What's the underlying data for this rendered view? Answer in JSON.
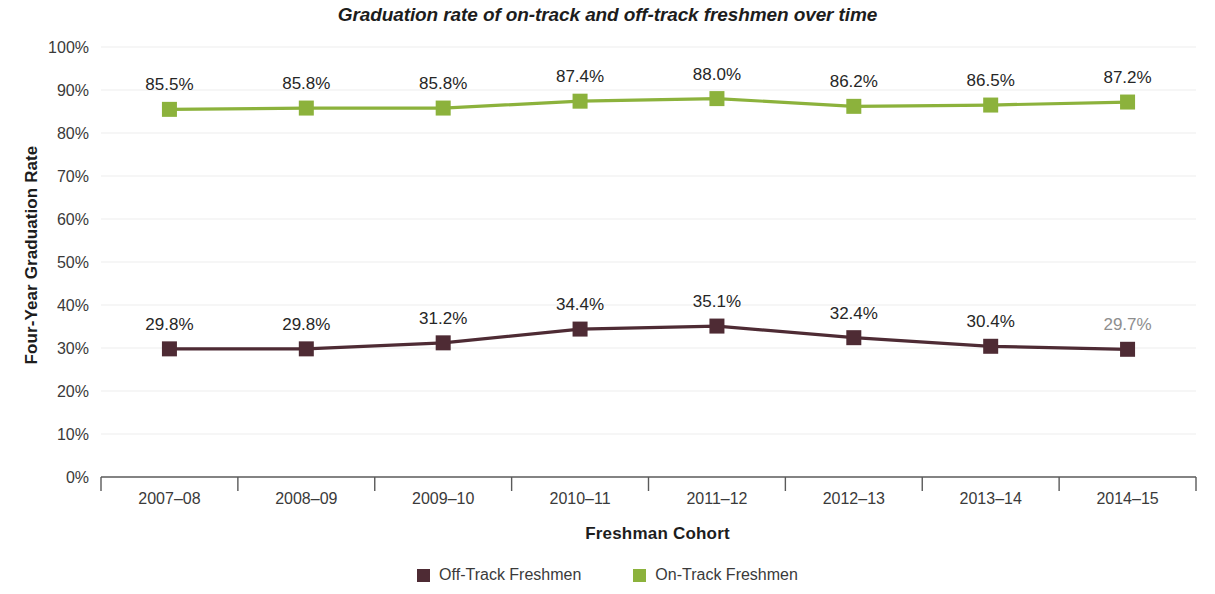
{
  "chart_data": {
    "type": "line",
    "title": "Graduation rate of on-track and off-track freshmen over time",
    "xlabel": "Freshman Cohort",
    "ylabel": "Four-Year Graduation Rate",
    "categories": [
      "2007–08",
      "2008–09",
      "2009–10",
      "2010–11",
      "2011–12",
      "2012–13",
      "2013–14",
      "2014–15"
    ],
    "ylim": [
      0,
      100
    ],
    "ytick_labels": [
      "0%",
      "10%",
      "20%",
      "30%",
      "40%",
      "50%",
      "60%",
      "70%",
      "80%",
      "90%",
      "100%"
    ],
    "ytick_values": [
      0,
      10,
      20,
      30,
      40,
      50,
      60,
      70,
      80,
      90,
      100
    ],
    "grid": "horizontal",
    "legend_position": "bottom-center",
    "series": [
      {
        "name": "Off-Track Freshmen",
        "color": "#4e2b34",
        "values": [
          29.8,
          29.8,
          31.2,
          34.4,
          35.1,
          32.4,
          30.4,
          29.7
        ],
        "labels": [
          "29.8%",
          "29.8%",
          "31.2%",
          "34.4%",
          "35.1%",
          "32.4%",
          "30.4%",
          "29.7%"
        ],
        "label_styles": [
          "normal",
          "normal",
          "normal",
          "normal",
          "normal",
          "normal",
          "normal",
          "muted"
        ]
      },
      {
        "name": "On-Track Freshmen",
        "color": "#8cb23c",
        "values": [
          85.5,
          85.8,
          85.8,
          87.4,
          88.0,
          86.2,
          86.5,
          87.2
        ],
        "labels": [
          "85.5%",
          "85.8%",
          "85.8%",
          "87.4%",
          "88.0%",
          "86.2%",
          "86.5%",
          "87.2%"
        ],
        "label_styles": [
          "normal",
          "normal",
          "normal",
          "normal",
          "normal",
          "normal",
          "normal",
          "normal"
        ]
      }
    ],
    "axis_color": "#5a5a5a",
    "grid_color": "#ededed",
    "label_muted_color": "#8e8e8e"
  },
  "legend": {
    "items": [
      {
        "label": "Off-Track Freshmen",
        "color": "#4e2b34"
      },
      {
        "label": "On-Track Freshmen",
        "color": "#8cb23c"
      }
    ]
  }
}
